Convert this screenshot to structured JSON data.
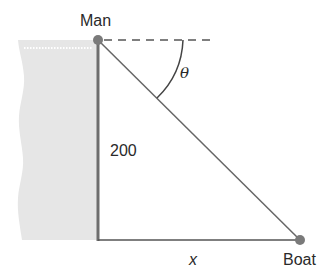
{
  "diagram": {
    "type": "right-triangle geometry figure",
    "labels": {
      "man": "Man",
      "boat": "Boat",
      "height": "200",
      "horizontal_distance": "x",
      "angle": "θ"
    },
    "elements": {
      "cliff": {
        "description": "shaded cliff/shore region left of vertical line"
      },
      "vertical_side": {
        "label": "200"
      },
      "horizontal_side": {
        "label": "x"
      },
      "hypotenuse": {
        "description": "line of sight from Man to Boat"
      },
      "horizontal_reference": {
        "style": "dashed"
      },
      "angle_arc": {
        "label": "θ",
        "between": "dashed horizontal and line of sight (angle of depression)"
      }
    },
    "colors": {
      "cliff_fill": "#e6e6e6",
      "vertical_line": "#6e6e6e",
      "lines": "#555555",
      "points": "#7a7a7a",
      "text": "#2a2a2a"
    }
  }
}
